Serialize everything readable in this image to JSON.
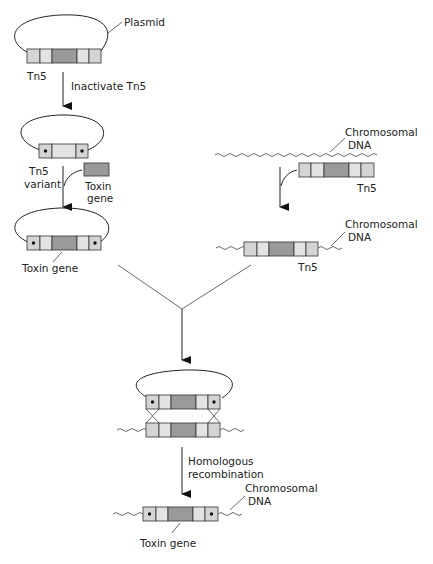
{
  "diagram": {
    "labels": {
      "plasmid": "Plasmid",
      "tn5_top": "Tn5",
      "inactivate": "Inactivate Tn5",
      "tn5_variant_1": "Tn5",
      "tn5_variant_2": "variant",
      "toxin_gene_1": "Toxin",
      "toxin_gene_2": "gene",
      "toxin_gene_plasmid": "Toxin gene",
      "chromosomal_dna_1a": "Chromosomal",
      "chromosomal_dna_1b": "DNA",
      "tn5_right": "Tn5",
      "chromosomal_dna_2a": "Chromosomal",
      "chromosomal_dna_2b": "DNA",
      "tn5_chrom": "Tn5",
      "homologous_1": "Homologous",
      "homologous_2": "recombination",
      "chromosomal_dna_3a": "Chromosomal",
      "chromosomal_dna_3b": "DNA",
      "toxin_gene_final": "Toxin gene"
    },
    "colors": {
      "light_segment": "#d4d4d4",
      "mid_segment": "#e3e3e3",
      "dark_segment": "#9a9a9a",
      "line": "#222222"
    }
  }
}
